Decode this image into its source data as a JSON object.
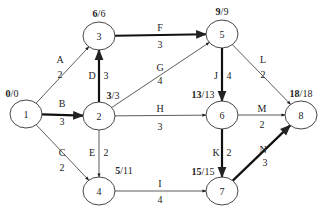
{
  "diagram": {
    "type": "activity-on-arrow network",
    "nodes": [
      {
        "id": "1",
        "x": 26,
        "y": 114,
        "early": "0",
        "late": "0"
      },
      {
        "id": "2",
        "x": 99,
        "y": 116,
        "early": "3",
        "late": "3"
      },
      {
        "id": "3",
        "x": 99,
        "y": 36,
        "early": "6",
        "late": "6"
      },
      {
        "id": "4",
        "x": 99,
        "y": 191,
        "early": "5",
        "late": "11"
      },
      {
        "id": "5",
        "x": 222,
        "y": 34,
        "early": "9",
        "late": "9"
      },
      {
        "id": "6",
        "x": 222,
        "y": 115,
        "early": "13",
        "late": "13"
      },
      {
        "id": "7",
        "x": 222,
        "y": 191,
        "early": "15",
        "late": "15"
      },
      {
        "id": "8",
        "x": 301,
        "y": 115,
        "early": "18",
        "late": "18"
      }
    ],
    "edges": [
      {
        "activity": "A",
        "duration": "2",
        "from": "1",
        "to": "3",
        "critical": false
      },
      {
        "activity": "B",
        "duration": "3",
        "from": "1",
        "to": "2",
        "critical": true
      },
      {
        "activity": "C",
        "duration": "2",
        "from": "1",
        "to": "4",
        "critical": false
      },
      {
        "activity": "D",
        "duration": "3",
        "from": "2",
        "to": "3",
        "critical": true
      },
      {
        "activity": "E",
        "duration": "2",
        "from": "2",
        "to": "4",
        "critical": false
      },
      {
        "activity": "F",
        "duration": "3",
        "from": "3",
        "to": "5",
        "critical": true
      },
      {
        "activity": "G",
        "duration": "4",
        "from": "2",
        "to": "5",
        "critical": false
      },
      {
        "activity": "H",
        "duration": "3",
        "from": "2",
        "to": "6",
        "critical": false
      },
      {
        "activity": "I",
        "duration": "4",
        "from": "4",
        "to": "7",
        "critical": false
      },
      {
        "activity": "J",
        "duration": "4",
        "from": "5",
        "to": "6",
        "critical": true
      },
      {
        "activity": "K",
        "duration": "2",
        "from": "6",
        "to": "7",
        "critical": true
      },
      {
        "activity": "L",
        "duration": "2",
        "from": "5",
        "to": "8",
        "critical": false
      },
      {
        "activity": "M",
        "duration": "2",
        "from": "6",
        "to": "8",
        "critical": false
      },
      {
        "activity": "N",
        "duration": "3",
        "from": "7",
        "to": "8",
        "critical": true
      }
    ]
  },
  "colors": {
    "line": "#333333",
    "critical": "#111111",
    "node_fill": "#ffffff"
  }
}
